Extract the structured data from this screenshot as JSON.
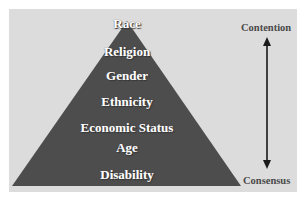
{
  "diagram": {
    "type": "pyramid",
    "levels": [
      {
        "label": "Race"
      },
      {
        "label": "Religion"
      },
      {
        "label": "Gender"
      },
      {
        "label": "Ethnicity"
      },
      {
        "label": "Economic Status"
      },
      {
        "label": "Age"
      },
      {
        "label": "Disability"
      }
    ],
    "scale": {
      "top_label": "Contention",
      "bottom_label": "Consensus",
      "arrow": "double-headed-vertical"
    },
    "colors": {
      "background_panel": "#dcdcdc",
      "pyramid_fill": "#4d4d4d",
      "level_text": "#ffffff",
      "side_text": "#4a4a4a",
      "arrow": "#1a1a1a"
    }
  }
}
